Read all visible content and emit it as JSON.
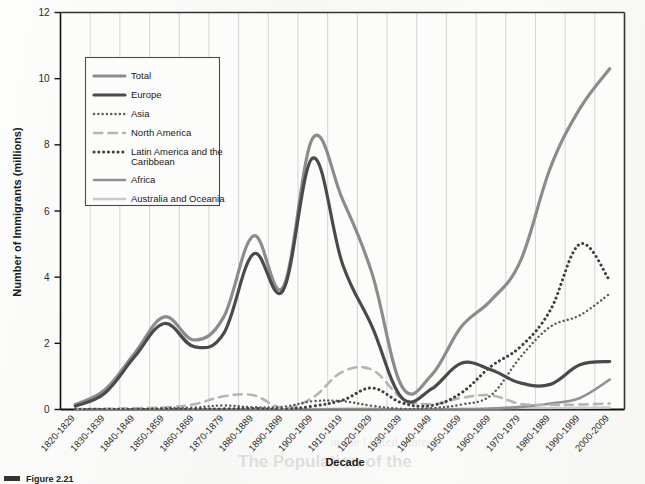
{
  "figure": {
    "caption_marker": "Figure 2.21",
    "ylabel": "Number of Immigrants (millions)",
    "xlabel": "Decade"
  },
  "legend": {
    "title": "",
    "items": [
      {
        "label": "Total",
        "style": "solid",
        "color": "#8c8c8c",
        "width": 3.2
      },
      {
        "label": "Europe",
        "style": "solid",
        "color": "#4a4a4a",
        "width": 3.2
      },
      {
        "label": "Asia",
        "style": "dotted-fine",
        "color": "#5a5a5a",
        "width": 2.4
      },
      {
        "label": "North America",
        "style": "dashed",
        "color": "#b5b5b5",
        "width": 2.6
      },
      {
        "label": "Latin America and the Caribbean",
        "style": "dotted-bold",
        "color": "#3f3f3f",
        "width": 3.0
      },
      {
        "label": "Africa",
        "style": "solid",
        "color": "#909090",
        "width": 2.6
      },
      {
        "label": "Australia and Oceania",
        "style": "solid",
        "color": "#c9c9c9",
        "width": 2.6
      }
    ]
  },
  "chart_data": {
    "type": "line",
    "title": "",
    "xlabel": "Decade",
    "ylabel": "Number of Immigrants (millions)",
    "ylim": [
      0,
      12
    ],
    "yticks": [
      0,
      2,
      4,
      6,
      8,
      10,
      12
    ],
    "grid": "vertical",
    "legend_position": "upper-left-inside",
    "categories": [
      "1820-1829",
      "1830-1839",
      "1840-1849",
      "1850-1859",
      "1860-1869",
      "1870-1879",
      "1880-1889",
      "1890-1899",
      "1900-1909",
      "1910-1919",
      "1920-1929",
      "1930-1939",
      "1940-1949",
      "1950-1959",
      "1960-1969",
      "1970-1979",
      "1980-1989",
      "1990-1999",
      "2000-2009"
    ],
    "series": [
      {
        "name": "Total",
        "values": [
          0.15,
          0.6,
          1.7,
          2.8,
          2.1,
          2.8,
          5.25,
          3.7,
          8.2,
          6.35,
          4.1,
          0.7,
          1.04,
          2.5,
          3.3,
          4.5,
          7.3,
          9.1,
          10.3
        ]
      },
      {
        "name": "Europe",
        "values": [
          0.1,
          0.5,
          1.6,
          2.6,
          1.9,
          2.3,
          4.7,
          3.6,
          7.6,
          4.4,
          2.5,
          0.35,
          0.62,
          1.4,
          1.2,
          0.8,
          0.76,
          1.35,
          1.45
        ]
      },
      {
        "name": "Asia",
        "values": [
          0.0,
          0.0,
          0.0,
          0.04,
          0.06,
          0.12,
          0.07,
          0.08,
          0.25,
          0.25,
          0.11,
          0.02,
          0.04,
          0.15,
          0.43,
          1.59,
          2.5,
          2.85,
          3.5
        ]
      },
      {
        "name": "North America",
        "values": [
          0.01,
          0.02,
          0.04,
          0.06,
          0.16,
          0.4,
          0.43,
          0.04,
          0.36,
          1.14,
          1.2,
          0.35,
          0.16,
          0.35,
          0.43,
          0.17,
          0.14,
          0.15,
          0.18
        ]
      },
      {
        "name": "Latin America and the Caribbean",
        "values": [
          0.0,
          0.01,
          0.01,
          0.01,
          0.01,
          0.02,
          0.03,
          0.01,
          0.1,
          0.28,
          0.65,
          0.2,
          0.12,
          0.5,
          1.3,
          1.9,
          3.0,
          5.0,
          3.9
        ]
      },
      {
        "name": "Africa",
        "values": [
          0.0,
          0.0,
          0.0,
          0.0,
          0.0,
          0.0,
          0.0,
          0.0,
          0.0,
          0.01,
          0.01,
          0.0,
          0.01,
          0.01,
          0.03,
          0.08,
          0.18,
          0.35,
          0.9
        ]
      },
      {
        "name": "Australia and Oceania",
        "values": [
          0.0,
          0.0,
          0.0,
          0.0,
          0.0,
          0.0,
          0.0,
          0.0,
          0.01,
          0.01,
          0.01,
          0.0,
          0.0,
          0.01,
          0.02,
          0.04,
          0.04,
          0.05,
          0.06
        ]
      }
    ]
  },
  "ghost": {
    "head": "The Population of the",
    "lines": [
      "in the United States"
    ]
  }
}
